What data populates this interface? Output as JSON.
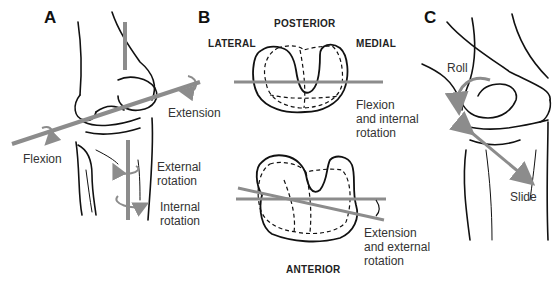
{
  "panels": {
    "a": {
      "letter": "A",
      "labels": {
        "flexion": "Flexion",
        "extension": "Extension",
        "external_rotation_1": "External",
        "external_rotation_2": "rotation",
        "internal_rotation_1": "Internal",
        "internal_rotation_2": "rotation"
      }
    },
    "b": {
      "letter": "B",
      "orientation": {
        "posterior": "POSTERIOR",
        "lateral": "LATERAL",
        "medial": "MEDIAL",
        "anterior": "ANTERIOR"
      },
      "labels": {
        "flex_int_1": "Flexion",
        "flex_int_2": "and internal",
        "flex_int_3": "rotation",
        "ext_ext_1": "Extension",
        "ext_ext_2": "and external",
        "ext_ext_3": "rotation"
      }
    },
    "c": {
      "letter": "C",
      "labels": {
        "roll": "Roll",
        "slide": "Slide"
      }
    }
  },
  "colors": {
    "line": "#111111",
    "axis": "#8c8c8c",
    "text": "#333333"
  }
}
